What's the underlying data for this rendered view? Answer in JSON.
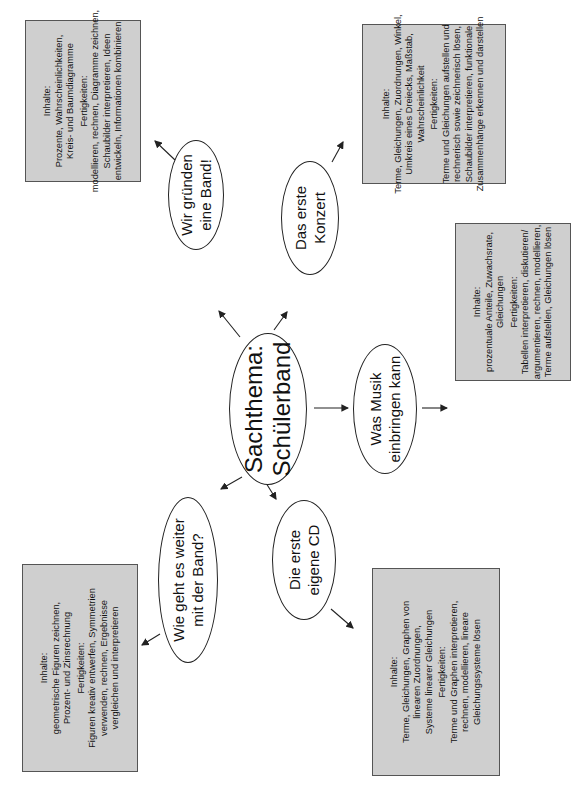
{
  "center": {
    "lines": [
      "Sachthema:",
      "Schülerband"
    ]
  },
  "topics": [
    {
      "id": "band",
      "lines": [
        "Wir gründen",
        "eine Band!"
      ]
    },
    {
      "id": "konzert",
      "lines": [
        "Das erste",
        "Konzert"
      ]
    },
    {
      "id": "musik",
      "lines": [
        "Was Musik",
        "einbringen kann"
      ]
    },
    {
      "id": "cd",
      "lines": [
        "Die erste",
        "eigene CD"
      ]
    },
    {
      "id": "weiter",
      "lines": [
        "Wie geht es weiter",
        "mit der Band?"
      ]
    }
  ],
  "boxes": [
    {
      "id": "band",
      "inhalte_label": "Inhalte:",
      "inhalte": [
        "Prozente, Wahrscheinlichkeiten,",
        "Kreis- und Baumdiagramme"
      ],
      "fertigkeiten_label": "Fertigkeiten:",
      "fertigkeiten": [
        "modellieren, rechnen, Diagramme zeichnen,",
        "Schaubilder interpretieren, Ideen",
        "entwickeln, Informationen kombinieren"
      ]
    },
    {
      "id": "konzert",
      "inhalte_label": "Inhalte:",
      "inhalte": [
        "Terme, Gleichungen, Zuordnungen, Winkel,",
        "Umkreis eines Dreiecks, Maßstab,",
        "Wahrscheinlichkeit"
      ],
      "fertigkeiten_label": "Fertigkeiten:",
      "fertigkeiten": [
        "Terme und Gleichungen aufstellen und",
        "rechnerisch sowie zeichnerisch lösen,",
        "Schaubilder interpretieren, funktionale",
        "Zusammenhänge erkennen und darstellen"
      ]
    },
    {
      "id": "musik",
      "inhalte_label": "Inhalte:",
      "inhalte": [
        "prozentuale Anteile, Zuwachsrate,",
        "Gleichungen"
      ],
      "fertigkeiten_label": "Fertigkeiten:",
      "fertigkeiten": [
        "Tabellen interpretieren, diskutieren/",
        "argumentieren, rechnen, modellieren,",
        "Terme aufstellen, Gleichungen lösen"
      ]
    },
    {
      "id": "cd",
      "inhalte_label": "Inhalte:",
      "inhalte": [
        "Terme, Gleichungen, Graphen von",
        "linearen Zuordnungen,",
        "Systeme linearer Gleichungen"
      ],
      "fertigkeiten_label": "Fertigkeiten:",
      "fertigkeiten": [
        "Terme und Graphen interpretieren,",
        "rechnen, modellieren, lineare",
        "Gleichungssysteme lösen"
      ]
    },
    {
      "id": "weiter",
      "inhalte_label": "Inhalte:",
      "inhalte": [
        "geometrische Figuren zeichnen,",
        "Prozent- und Zinsrechnung"
      ],
      "fertigkeiten_label": "Fertigkeiten:",
      "fertigkeiten": [
        "Figuren kreativ entwerfen, Symmetrien",
        "verwenden, rechnen, Ergebnisse",
        "vergleichen und interpretieren"
      ]
    }
  ],
  "colors": {
    "box_fill": "#cfcfcf",
    "box_border": "#555555",
    "line": "#222222"
  }
}
